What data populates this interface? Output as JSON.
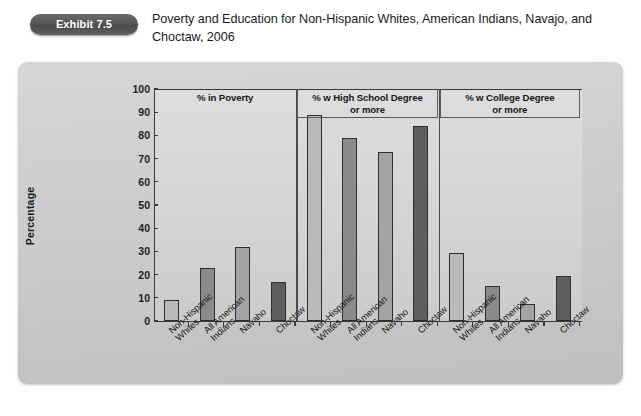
{
  "header": {
    "badge": "Exhibit 7.5",
    "title": "Poverty and Education for Non-Hispanic Whites, American Indians, Navajo, and Choctaw, 2006"
  },
  "chart_data": {
    "type": "bar",
    "title": "Poverty and Education for Non-Hispanic Whites, American Indians, Navajo, and Choctaw, 2006",
    "xlabel": "",
    "ylabel": "Percentage",
    "ylim": [
      0,
      100
    ],
    "ytick_labels": [
      "0",
      "10",
      "20",
      "30",
      "40",
      "50",
      "60",
      "70",
      "80",
      "90",
      "100"
    ],
    "grid": false,
    "legend": "none",
    "categories": [
      "Non-Hispanic Whites",
      "All American Indians",
      "Navaho",
      "Choctaw"
    ],
    "category_lines": [
      [
        "Non-Hispanic",
        "Whites"
      ],
      [
        "All American",
        "Indians"
      ],
      [
        "Navaho",
        ""
      ],
      [
        "Choctaw",
        ""
      ]
    ],
    "bar_colors": [
      "#b9b9b9",
      "#8a8a8a",
      "#a3a3a3",
      "#5e5e5e"
    ],
    "panels": [
      {
        "label": "%  in Poverty",
        "label_lines": [
          "%  in Poverty",
          ""
        ],
        "boxed": false,
        "values": [
          9,
          23,
          32,
          17
        ]
      },
      {
        "label": "% w High School Degree or more",
        "label_lines": [
          "% w High School Degree",
          "or more"
        ],
        "boxed": true,
        "values": [
          89,
          79,
          73,
          84
        ]
      },
      {
        "label": "% w College Degree or more",
        "label_lines": [
          "% w College Degree",
          "or more"
        ],
        "boxed": true,
        "values": [
          29.5,
          15,
          7.5,
          19.5
        ]
      }
    ]
  }
}
